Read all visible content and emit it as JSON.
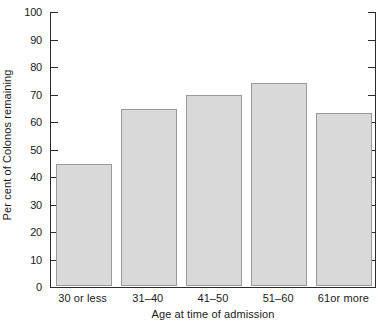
{
  "chart_data": {
    "type": "bar",
    "title": "",
    "subtitle": "",
    "xlabel": "Age at time of admission",
    "ylabel": "Per cent of Colonos remaining",
    "categories": [
      "30 or less",
      "31–40",
      "41–50",
      "51–60",
      "61or more"
    ],
    "values": [
      44.5,
      64.5,
      69.5,
      74,
      63
    ],
    "ylim": [
      0,
      100
    ],
    "ytick_labels": [
      "0",
      "10",
      "20",
      "30",
      "40",
      "50",
      "60",
      "70",
      "80",
      "90",
      "100"
    ],
    "ytick_values": [
      0,
      10,
      20,
      30,
      40,
      50,
      60,
      70,
      80,
      90,
      100
    ],
    "grid": false,
    "legend": null,
    "series": [
      {
        "name": "Per cent of Colonos remaining",
        "values": [
          44.5,
          64.5,
          69.5,
          74,
          63
        ]
      }
    ],
    "bar_fill_color": "#d9d9d9",
    "bar_border_color": "#9a9a9a",
    "axis_color": "#2b2b2b",
    "background_color": "#ffffff"
  },
  "caption_remnant": ""
}
